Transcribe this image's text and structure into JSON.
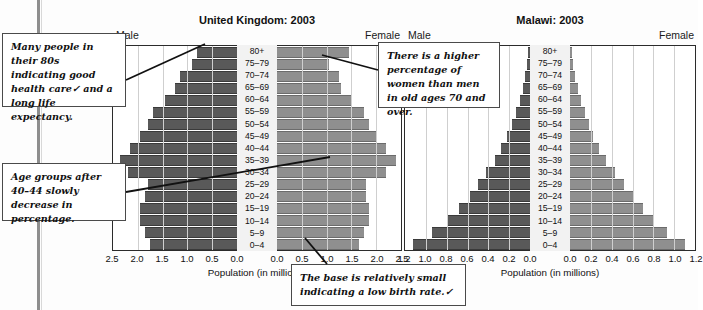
{
  "page": {
    "cropped_header": ""
  },
  "charts": [
    {
      "id": "uk",
      "title": "United Kingdom: 2003",
      "male_label": "Male",
      "female_label": "Female",
      "axis_title": "Population (in millions)",
      "left_ticks": [
        "2.5",
        "2.0",
        "1.5",
        "1.0",
        "0.5",
        "0.0"
      ],
      "right_ticks": [
        "0.0",
        "0.5",
        "1.0",
        "1.5",
        "2.0",
        "2.5"
      ]
    },
    {
      "id": "malawi",
      "title": "Malawi: 2003",
      "male_label": "Male",
      "female_label": "Female",
      "axis_title": "Population (in millions)",
      "left_ticks": [
        "1.2",
        "1.0",
        "0.8",
        "0.6",
        "0.4",
        "0.2",
        "0.0"
      ],
      "right_ticks": [
        "0.0",
        "0.2",
        "0.4",
        "0.6",
        "0.8",
        "1.0",
        "1.2"
      ]
    }
  ],
  "notes": [
    {
      "id": "note-1",
      "text": "Many people in their 80s indicating good health care✓ and a long life expectancy."
    },
    {
      "id": "note-2",
      "text": "Age groups after 40–44 slowly decrease in percentage."
    },
    {
      "id": "note-3",
      "text": "There is a higher percentage of women than men in old ages 70 and over."
    },
    {
      "id": "note-4",
      "text": "The base is relatively small indicating a low birth rate.✓"
    }
  ],
  "colors": {
    "male_bar": "#595959",
    "female_bar": "#8f8f8f",
    "axis": "#2b2b2b",
    "grid": "#cfcfcf",
    "center_band": "#f2f2f2"
  },
  "chart_data": [
    {
      "type": "bar",
      "subtype": "population-pyramid",
      "title": "United Kingdom: 2003",
      "xlabel": "Population (in millions)",
      "ylabel": "",
      "xlim": [
        0,
        2.5
      ],
      "grid": true,
      "legend": [
        "Male",
        "Female"
      ],
      "legend_position": "top-left-and-top-right",
      "categories": [
        "0–4",
        "5–9",
        "10–14",
        "15–19",
        "20–24",
        "25–29",
        "30–34",
        "35–39",
        "40–44",
        "45–49",
        "50–54",
        "55–59",
        "60–64",
        "65–69",
        "70–74",
        "75–79",
        "80+"
      ],
      "series": [
        {
          "name": "Male",
          "values": [
            1.75,
            1.85,
            1.95,
            1.95,
            1.85,
            1.8,
            2.2,
            2.35,
            2.15,
            1.95,
            1.8,
            1.7,
            1.45,
            1.25,
            1.15,
            0.9,
            0.8
          ]
        },
        {
          "name": "Female",
          "values": [
            1.65,
            1.75,
            1.85,
            1.85,
            1.8,
            1.8,
            2.2,
            2.4,
            2.2,
            2.0,
            1.85,
            1.75,
            1.5,
            1.3,
            1.25,
            1.05,
            1.45
          ]
        }
      ]
    },
    {
      "type": "bar",
      "subtype": "population-pyramid",
      "title": "Malawi: 2003",
      "xlabel": "Population (in millions)",
      "ylabel": "",
      "xlim": [
        0,
        1.2
      ],
      "grid": true,
      "legend": [
        "Male",
        "Female"
      ],
      "legend_position": "top-left-and-top-right",
      "categories": [
        "0–4",
        "5–9",
        "10–14",
        "15–19",
        "20–24",
        "25–29",
        "30–34",
        "35–39",
        "40–44",
        "45–49",
        "50–54",
        "55–59",
        "60–64",
        "65–69",
        "70–74",
        "75–79",
        "80+"
      ],
      "series": [
        {
          "name": "Male",
          "values": [
            1.12,
            0.94,
            0.8,
            0.68,
            0.58,
            0.5,
            0.42,
            0.34,
            0.28,
            0.22,
            0.17,
            0.13,
            0.1,
            0.07,
            0.05,
            0.03,
            0.02
          ]
        },
        {
          "name": "Female",
          "values": [
            1.1,
            0.93,
            0.8,
            0.7,
            0.6,
            0.52,
            0.43,
            0.35,
            0.28,
            0.22,
            0.18,
            0.14,
            0.11,
            0.08,
            0.05,
            0.03,
            0.02
          ]
        }
      ]
    }
  ]
}
